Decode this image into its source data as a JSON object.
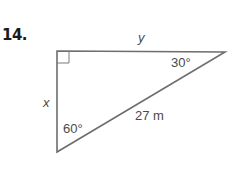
{
  "problem": {
    "number": "14."
  },
  "triangle": {
    "vertices": {
      "right_angle": [
        57,
        51
      ],
      "top_right": [
        225,
        52
      ],
      "bottom": [
        57,
        152
      ]
    },
    "stroke_color": "#6e6e6e",
    "labels": {
      "top_side": "y",
      "left_side": "x",
      "hypotenuse": "27 m",
      "top_right_angle": "30°",
      "bottom_angle": "60°"
    },
    "right_angle_marker": true
  }
}
